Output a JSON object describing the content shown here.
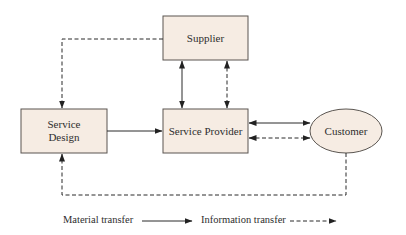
{
  "diagram": {
    "colors": {
      "node_fill": "#f6ece3",
      "node_stroke": "#5a5550",
      "edge": "#2a2a2a"
    },
    "nodes": [
      {
        "id": "supplier",
        "label": "Supplier",
        "shape": "rect"
      },
      {
        "id": "service_design",
        "label": "Service\nDesign",
        "shape": "rect"
      },
      {
        "id": "service_provider",
        "label": "Service Provider",
        "shape": "rect"
      },
      {
        "id": "customer",
        "label": "Customer",
        "shape": "ellipse"
      }
    ],
    "labels": {
      "supplier": "Supplier",
      "service_design_line1": "Service",
      "service_design_line2": "Design",
      "service_provider": "Service Provider",
      "customer": "Customer"
    },
    "edges": [
      {
        "from": "supplier",
        "to": "service_design",
        "type": "information",
        "style": "dashed",
        "direction": "one-way"
      },
      {
        "from": "supplier",
        "to": "service_provider",
        "type": "material",
        "style": "solid",
        "direction": "two-way"
      },
      {
        "from": "supplier",
        "to": "service_provider",
        "type": "information",
        "style": "dashed",
        "direction": "two-way"
      },
      {
        "from": "service_design",
        "to": "service_provider",
        "type": "material",
        "style": "solid",
        "direction": "one-way"
      },
      {
        "from": "service_provider",
        "to": "customer",
        "type": "material",
        "style": "solid",
        "direction": "two-way"
      },
      {
        "from": "service_provider",
        "to": "customer",
        "type": "information",
        "style": "dashed",
        "direction": "two-way"
      },
      {
        "from": "customer",
        "to": "service_design",
        "type": "information",
        "style": "dashed",
        "direction": "one-way"
      }
    ],
    "legend": {
      "material": "Material transfer",
      "information": "Information transfer"
    }
  }
}
